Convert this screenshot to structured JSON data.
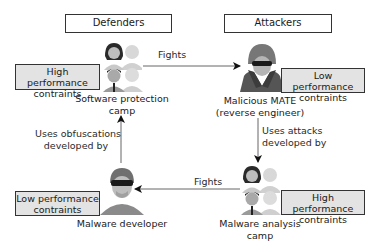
{
  "headers": {
    "defenders": "Defenders",
    "attackers": "Attackers"
  },
  "nodes": {
    "software_protection": {
      "caption_line1": "Software protection",
      "caption_line2": "camp",
      "constraint_line1": "High performance",
      "constraint_line2": "contraints",
      "icon": "group-of-people-icon"
    },
    "malicious_mate": {
      "caption_line1": "Malicious MATE",
      "caption_line2": "(reverse engineer)",
      "constraint_line1": "Low performance",
      "constraint_line2": "contraints",
      "icon": "hooded-hacker-icon"
    },
    "malware_developer": {
      "caption_line1": "Malware developer",
      "constraint_line1": "Low performance",
      "constraint_line2": "contraints",
      "icon": "hacker-icon"
    },
    "malware_analysis": {
      "caption_line1": "Malware analysis",
      "caption_line2": "camp",
      "constraint_line1": "High performance",
      "constraint_line2": "contraints",
      "icon": "group-of-people-icon"
    }
  },
  "edges": {
    "top_fights": "Fights",
    "bottom_fights": "Fights",
    "uses_attacks_line1": "Uses attacks",
    "uses_attacks_line2": "developed by",
    "uses_obfuscations_line1": "Uses obfuscations",
    "uses_obfuscations_line2": "developed by"
  },
  "colors": {
    "constraint_box_fill": "#e3e3e3",
    "border": "#333333",
    "arrow": "#555555"
  }
}
